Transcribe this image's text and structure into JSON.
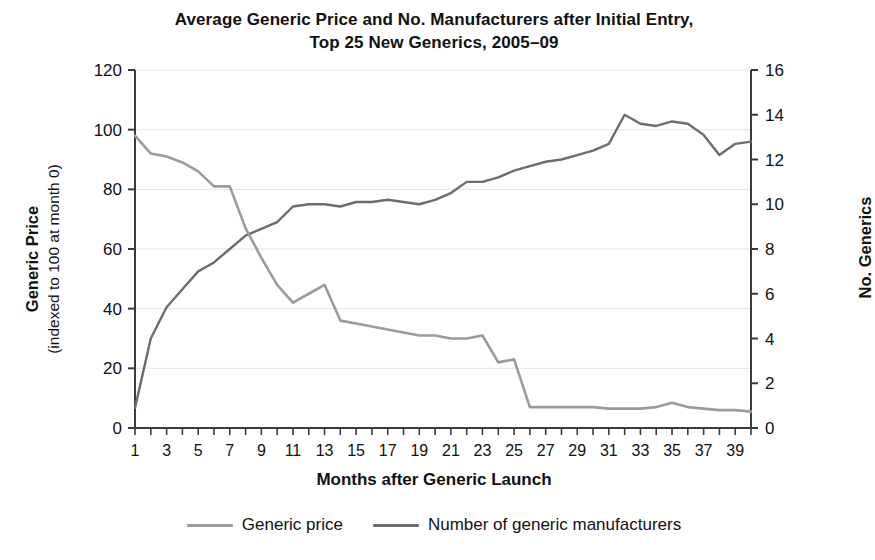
{
  "chart_data": {
    "type": "line",
    "title": "Average Generic Price and No. Manufacturers after Initial Entry, Top 25 New Generics, 2005–09",
    "title_line1": "Average Generic Price and No. Manufacturers after Initial Entry,",
    "title_line2": "Top 25 New Generics, 2005–09",
    "xlabel": "Months after Generic Launch",
    "ylabel": "Generic Price (indexed to 100 at month 0)",
    "ylabel_line1": "Generic Price",
    "ylabel_line2": "(indexed to 100 at month 0)",
    "y2label": "No. Generics",
    "xlim": [
      1,
      40
    ],
    "ylim": [
      0,
      120
    ],
    "y2lim": [
      0,
      16
    ],
    "yticks": [
      0,
      20,
      40,
      60,
      80,
      100,
      120
    ],
    "y2ticks": [
      0,
      2,
      4,
      6,
      8,
      10,
      12,
      14,
      16
    ],
    "xticks": [
      1,
      3,
      5,
      7,
      9,
      11,
      13,
      15,
      17,
      19,
      21,
      23,
      25,
      27,
      29,
      31,
      33,
      35,
      37,
      39
    ],
    "xtick_minor_every": 1,
    "grid": "horizontal-only-light",
    "legend_position": "bottom-center",
    "x": [
      1,
      2,
      3,
      4,
      5,
      6,
      7,
      8,
      9,
      10,
      11,
      12,
      13,
      14,
      15,
      16,
      17,
      18,
      19,
      20,
      21,
      22,
      23,
      24,
      25,
      26,
      27,
      28,
      29,
      30,
      31,
      32,
      33,
      34,
      35,
      36,
      37,
      38,
      39,
      40
    ],
    "series": [
      {
        "name": "Generic price",
        "axis": "left",
        "color": "#9b9b9b",
        "values": [
          98,
          92,
          91,
          89,
          86,
          81,
          81,
          67,
          57,
          48,
          42,
          45,
          48,
          36,
          35,
          34,
          33,
          32,
          31,
          31,
          30,
          30,
          31,
          22,
          23,
          7,
          7,
          7,
          7,
          7,
          6.5,
          6.5,
          6.5,
          7,
          8.5,
          7,
          6.5,
          6,
          6,
          5.5
        ]
      },
      {
        "name": "Number of generic manufacturers",
        "axis": "right",
        "color": "#6d6d6d",
        "values": [
          0.9,
          4.0,
          5.4,
          6.2,
          7.0,
          7.4,
          8.0,
          8.6,
          8.9,
          9.2,
          9.9,
          10.0,
          10.0,
          9.9,
          10.1,
          10.1,
          10.2,
          10.1,
          10.0,
          10.2,
          10.5,
          11.0,
          11.0,
          11.2,
          11.5,
          11.7,
          11.9,
          12.0,
          12.2,
          12.4,
          12.7,
          14.0,
          13.6,
          13.5,
          13.7,
          13.6,
          13.1,
          12.2,
          12.7,
          12.8
        ]
      }
    ]
  },
  "legend": {
    "items": [
      {
        "label": "Generic price",
        "color": "#9b9b9b"
      },
      {
        "label": "Number of generic manufacturers",
        "color": "#6d6d6d"
      }
    ]
  },
  "colors": {
    "price_line": "#9b9b9b",
    "manufacturers_line": "#6d6d6d",
    "axis": "#3a3a3a",
    "grid": "#e4e4e4",
    "text": "#111111",
    "background": "#ffffff"
  }
}
